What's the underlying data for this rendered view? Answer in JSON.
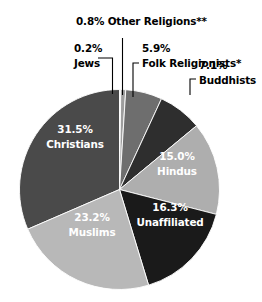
{
  "chart_data": {
    "type": "pie",
    "title": "",
    "subtitle": "",
    "xlabel": "",
    "ylabel": "",
    "legend_position": "none",
    "grid": false,
    "total_percent": 100.0,
    "start_angle_deg": 0,
    "direction": "clockwise",
    "categories": [
      "Other Religions**",
      "Folk Religionists*",
      "Buddhists",
      "Hindus",
      "Unaffiliated",
      "Muslims",
      "Christians",
      "Jews"
    ],
    "values": [
      0.8,
      5.9,
      7.1,
      15.0,
      16.3,
      23.2,
      31.5,
      0.2
    ],
    "slices": [
      {
        "name": "Other Religions**",
        "percent": 0.8,
        "percent_label": "0.8%",
        "label": "Other Religions**",
        "color": "#9e9e9e",
        "label_placement": "outside",
        "label_color": "#000000"
      },
      {
        "name": "Folk Religionists*",
        "percent": 5.9,
        "percent_label": "5.9%",
        "label": "Folk Religionists*",
        "color": "#6e6e6e",
        "label_placement": "outside",
        "label_color": "#000000"
      },
      {
        "name": "Buddhists",
        "percent": 7.1,
        "percent_label": "7.1%",
        "label": "Buddhists",
        "color": "#2e2e2e",
        "label_placement": "outside",
        "label_color": "#000000"
      },
      {
        "name": "Hindus",
        "percent": 15.0,
        "percent_label": "15.0%",
        "label": "Hindus",
        "color": "#aeaeae",
        "label_placement": "inside",
        "label_color": "#ffffff"
      },
      {
        "name": "Unaffiliated",
        "percent": 16.3,
        "percent_label": "16.3%",
        "label": "Unaffiliated",
        "color": "#1a1a1a",
        "label_placement": "inside",
        "label_color": "#ffffff"
      },
      {
        "name": "Muslims",
        "percent": 23.2,
        "percent_label": "23.2%",
        "label": "Muslims",
        "color": "#b8b8b8",
        "label_placement": "inside",
        "label_color": "#ffffff"
      },
      {
        "name": "Christians",
        "percent": 31.5,
        "percent_label": "31.5%",
        "label": "Christians",
        "color": "#4a4a4a",
        "label_placement": "inside",
        "label_color": "#ffffff"
      },
      {
        "name": "Jews",
        "percent": 0.2,
        "percent_label": "0.2%",
        "label": "Jews",
        "color": "#d8d8d8",
        "label_placement": "outside",
        "label_color": "#000000"
      }
    ],
    "footnotes": [
      "*",
      "**"
    ]
  },
  "labels": {
    "other_religions": {
      "line1": "0.8% Other Religions**"
    },
    "jews": {
      "line1": "0.2%",
      "line2": "Jews"
    },
    "folk_religionists": {
      "line1": "5.9%",
      "line2": "Folk Religionists*"
    },
    "buddhists": {
      "line1": "7.1%",
      "line2": "Buddhists"
    },
    "hindus": {
      "line1": "15.0%",
      "line2": "Hindus"
    },
    "unaffiliated": {
      "line1": "16.3%",
      "line2": "Unaffiliated"
    },
    "muslims": {
      "line1": "23.2%",
      "line2": "Muslims"
    },
    "christians": {
      "line1": "31.5%",
      "line2": "Christians"
    }
  }
}
